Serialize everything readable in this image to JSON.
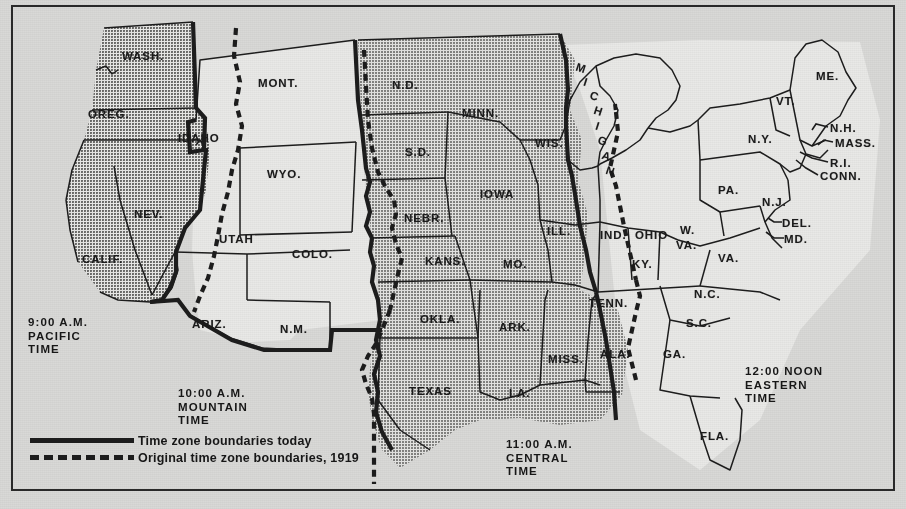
{
  "map": {
    "title": "United States Time Zone Map",
    "frame_color": "#2a2a2a",
    "paper_color": "#d9d9d7",
    "shaded_zone_color": "#9b9b99",
    "light_zone_color": "#e9e9e7",
    "boundary_color": "#1d1d1d"
  },
  "zones": [
    {
      "id": "pacific",
      "time": "9:00 A.M.",
      "name": "PACIFIC",
      "word": "TIME",
      "shaded": true,
      "x": 28,
      "y": 316
    },
    {
      "id": "mountain",
      "time": "10:00 A.M.",
      "name": "MOUNTAIN",
      "word": "TIME",
      "shaded": false,
      "x": 178,
      "y": 387
    },
    {
      "id": "central",
      "time": "11:00 A.M.",
      "name": "CENTRAL",
      "word": "TIME",
      "shaded": true,
      "x": 506,
      "y": 438
    },
    {
      "id": "eastern",
      "time": "12:00 NOON",
      "name": "EASTERN",
      "word": "TIME",
      "shaded": false,
      "x": 745,
      "y": 365
    }
  ],
  "legend": {
    "solid_label": "Time zone boundaries today",
    "dashed_label": "Original time zone boundaries, 1919",
    "solid_icon": "solid-line-swatch",
    "dashed_icon": "dashed-line-swatch"
  },
  "states": [
    {
      "abbr": "WASH.",
      "x": 122,
      "y": 50,
      "size": "state"
    },
    {
      "abbr": "OREG.",
      "x": 88,
      "y": 108,
      "size": "state"
    },
    {
      "abbr": "IDAHO",
      "x": 178,
      "y": 132,
      "size": "state"
    },
    {
      "abbr": "MONT.",
      "x": 258,
      "y": 77,
      "size": "state"
    },
    {
      "abbr": "N.D.",
      "x": 392,
      "y": 79,
      "size": "state"
    },
    {
      "abbr": "S.D.",
      "x": 405,
      "y": 146,
      "size": "state"
    },
    {
      "abbr": "MINN.",
      "x": 462,
      "y": 107,
      "size": "state"
    },
    {
      "abbr": "WIS.",
      "x": 535,
      "y": 137,
      "size": "state"
    },
    {
      "abbr": "WYO.",
      "x": 267,
      "y": 168,
      "size": "state"
    },
    {
      "abbr": "NEV.",
      "x": 134,
      "y": 208,
      "size": "state"
    },
    {
      "abbr": "UTAH",
      "x": 219,
      "y": 233,
      "size": "state"
    },
    {
      "abbr": "COLO.",
      "x": 292,
      "y": 248,
      "size": "state"
    },
    {
      "abbr": "NEBR.",
      "x": 404,
      "y": 212,
      "size": "state"
    },
    {
      "abbr": "IOWA",
      "x": 480,
      "y": 188,
      "size": "state"
    },
    {
      "abbr": "ILL.",
      "x": 547,
      "y": 225,
      "size": "state"
    },
    {
      "abbr": "IND.",
      "x": 600,
      "y": 229,
      "size": "state"
    },
    {
      "abbr": "OHIO",
      "x": 635,
      "y": 229,
      "size": "state"
    },
    {
      "abbr": "CALIF.",
      "x": 82,
      "y": 253,
      "size": "state"
    },
    {
      "abbr": "ARIZ.",
      "x": 192,
      "y": 318,
      "size": "state"
    },
    {
      "abbr": "N.M.",
      "x": 280,
      "y": 323,
      "size": "state"
    },
    {
      "abbr": "KANS.",
      "x": 425,
      "y": 255,
      "size": "state"
    },
    {
      "abbr": "MO.",
      "x": 503,
      "y": 258,
      "size": "state"
    },
    {
      "abbr": "KY.",
      "x": 632,
      "y": 258,
      "size": "state"
    },
    {
      "abbr": "OKLA.",
      "x": 420,
      "y": 313,
      "size": "state"
    },
    {
      "abbr": "ARK.",
      "x": 499,
      "y": 321,
      "size": "state"
    },
    {
      "abbr": "TENN.",
      "x": 589,
      "y": 297,
      "size": "state"
    },
    {
      "abbr": "TEXAS",
      "x": 409,
      "y": 385,
      "size": "state"
    },
    {
      "abbr": "LA.",
      "x": 509,
      "y": 387,
      "size": "state"
    },
    {
      "abbr": "MISS.",
      "x": 548,
      "y": 353,
      "size": "state"
    },
    {
      "abbr": "ALA.",
      "x": 600,
      "y": 348,
      "size": "state"
    },
    {
      "abbr": "GA.",
      "x": 663,
      "y": 348,
      "size": "state"
    },
    {
      "abbr": "FLA.",
      "x": 700,
      "y": 430,
      "size": "state"
    },
    {
      "abbr": "S.C.",
      "x": 686,
      "y": 317,
      "size": "state"
    },
    {
      "abbr": "N.C.",
      "x": 694,
      "y": 288,
      "size": "state"
    },
    {
      "abbr": "VA.",
      "x": 718,
      "y": 252,
      "size": "state"
    },
    {
      "abbr": "W.",
      "x": 680,
      "y": 224,
      "size": "state"
    },
    {
      "abbr": "VA.",
      "x": 676,
      "y": 239,
      "size": "state"
    },
    {
      "abbr": "PA.",
      "x": 718,
      "y": 184,
      "size": "state"
    },
    {
      "abbr": "N.Y.",
      "x": 748,
      "y": 133,
      "size": "state"
    },
    {
      "abbr": "VT.",
      "x": 776,
      "y": 95,
      "size": "state"
    },
    {
      "abbr": "ME.",
      "x": 816,
      "y": 70,
      "size": "state"
    },
    {
      "abbr": "N.H.",
      "x": 830,
      "y": 122,
      "size": "state"
    },
    {
      "abbr": "MASS.",
      "x": 835,
      "y": 137,
      "size": "state"
    },
    {
      "abbr": "R.I.",
      "x": 830,
      "y": 157,
      "size": "state"
    },
    {
      "abbr": "CONN.",
      "x": 820,
      "y": 170,
      "size": "state"
    },
    {
      "abbr": "N.J.",
      "x": 762,
      "y": 196,
      "size": "state"
    },
    {
      "abbr": "DEL.",
      "x": 782,
      "y": 217,
      "size": "state"
    },
    {
      "abbr": "MD.",
      "x": 784,
      "y": 233,
      "size": "state"
    },
    {
      "abbr": "MICHIGAN",
      "x": 0,
      "y": 0,
      "size": "state"
    }
  ],
  "michigan": {
    "letters": [
      "M",
      "I",
      "C",
      "H",
      "I",
      "G",
      "A",
      "N"
    ],
    "label": "MICHIGAN"
  }
}
